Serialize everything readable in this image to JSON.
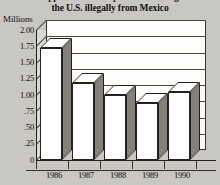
{
  "title": {
    "line1": "Apprehensions of persons entering",
    "line2": "the U.S. illegally from Mexico"
  },
  "axis": {
    "y_unit": "Millions",
    "y_ticks": [
      "2.00",
      "1.75",
      "1.50",
      "1.25",
      "1.00",
      ".75",
      ".50",
      ".25",
      "0"
    ],
    "x_ticks": [
      "1986",
      "1987",
      "1988",
      "1989",
      "1990"
    ]
  },
  "colors": {
    "page_background": "#c8c7c2",
    "plot_background": "#fdfdfb",
    "bar_front": "#ffffff",
    "bar_side": "#3a362f",
    "outline": "#24211c",
    "gridline": "#4a463f"
  },
  "chart_data": {
    "type": "bar",
    "title": "Apprehensions of persons entering the U.S. illegally from Mexico",
    "xlabel": "",
    "ylabel": "Millions",
    "categories": [
      "1986",
      "1987",
      "1988",
      "1989",
      "1990"
    ],
    "values": [
      1.72,
      1.19,
      1.0,
      0.87,
      1.05
    ],
    "ylim": [
      0,
      2.0
    ],
    "ytick_values": [
      0,
      0.25,
      0.5,
      0.75,
      1.0,
      1.25,
      1.5,
      1.75,
      2.0
    ],
    "grid": true,
    "legend": null,
    "style": "3d-column"
  }
}
